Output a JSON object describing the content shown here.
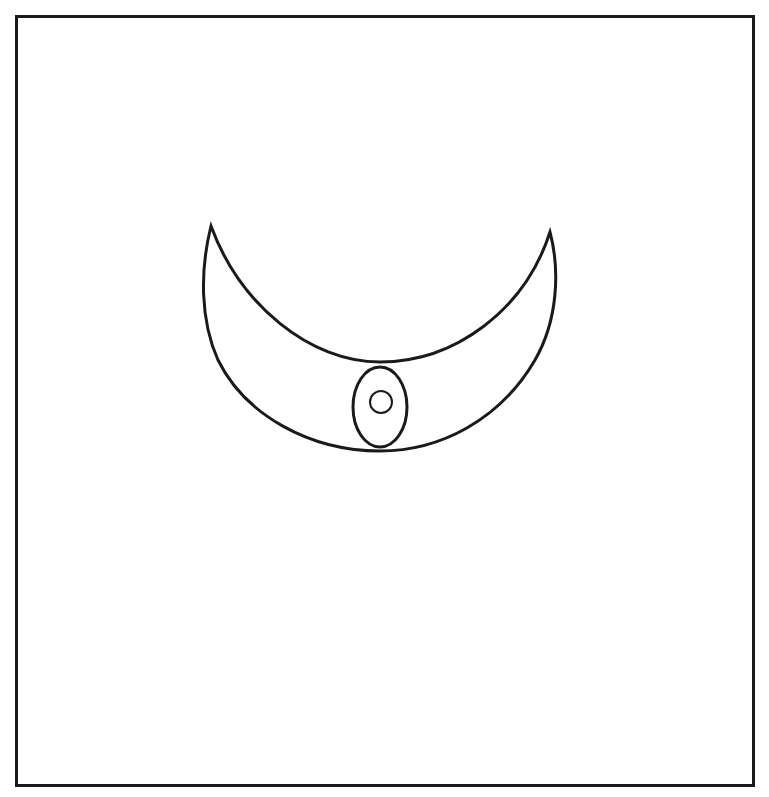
{
  "figure": {
    "stroke_color": "#1a1a1a",
    "background_color": "#ffffff",
    "frame": {
      "x": 15,
      "y": 15,
      "width": 740,
      "height": 772,
      "stroke_width": 3
    },
    "crescent": {
      "left_tip": [
        211,
        226
      ],
      "right_tip": [
        550,
        232
      ],
      "inner_arc_bottom_y": 362,
      "outer_arc_bottom_y": 451,
      "outer_left_x": 206,
      "outer_right_x": 555
    },
    "oval": {
      "cx": 380,
      "cy": 407,
      "rx": 27,
      "ry": 40
    },
    "inner_circle": {
      "cx": 381,
      "cy": 402,
      "r": 11
    }
  }
}
